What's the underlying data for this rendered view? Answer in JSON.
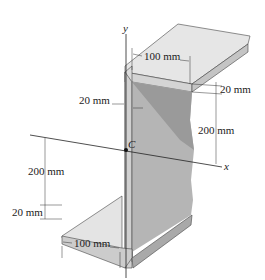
{
  "figure": {
    "type": "z-section-beam",
    "axes": {
      "y_label": "y",
      "x_label": "x",
      "centroid_label": "C"
    },
    "dimensions": {
      "top_flange_width": "100 mm",
      "top_flange_thickness": "20 mm",
      "web_thickness": "20 mm",
      "web_upper_height": "200 mm",
      "web_lower_height": "200 mm",
      "bottom_flange_thickness": "20 mm",
      "bottom_flange_width": "100 mm"
    },
    "colors": {
      "flange_top_face": "#e6e6e6",
      "flange_front_face": "#cfcfcf",
      "web_face": "#b9b9b9",
      "web_dark": "#9a9a9a",
      "web_edge": "#dcdcdc",
      "line": "#222222"
    }
  }
}
